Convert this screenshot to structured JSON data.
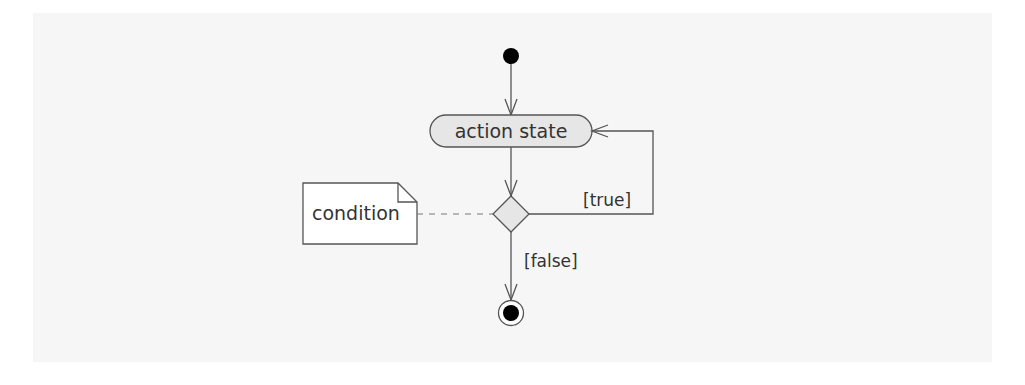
{
  "diagram": {
    "type": "UML activity diagram",
    "colors": {
      "background": "#ffffff",
      "panel": "#f6f6f6",
      "stroke": "#555555",
      "node_fill": "#e6e6e6",
      "note_fill": "#ffffff",
      "text": "#333333",
      "solid_fill": "#000000"
    },
    "nodes": {
      "initial": {
        "label": "",
        "shape": "filled-circle"
      },
      "action": {
        "label": "action state",
        "shape": "rounded-rectangle"
      },
      "decision": {
        "label": "",
        "shape": "diamond"
      },
      "final": {
        "label": "",
        "shape": "bullseye-circle"
      },
      "note": {
        "label": "condition",
        "shape": "dog-eared-note"
      }
    },
    "edges": {
      "initial_to_action": {
        "label": ""
      },
      "action_to_decision": {
        "label": ""
      },
      "decision_true_loop": {
        "label": "[true]"
      },
      "decision_false_to_final": {
        "label": "[false]"
      },
      "note_to_decision": {
        "label": "",
        "style": "dashed"
      }
    }
  }
}
